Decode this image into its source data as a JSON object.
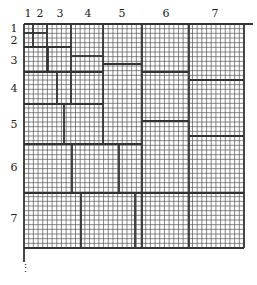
{
  "diagram": {
    "column_labels": [
      "1",
      "2",
      "3",
      "4",
      "5",
      "6",
      "7"
    ],
    "row_labels": [
      "1",
      "2",
      "3",
      "4",
      "5",
      "6",
      "7"
    ],
    "continuation_marker": "⋮",
    "grid": {
      "left": 24,
      "top": 24,
      "right": 244,
      "bottom": 248,
      "cell": 4.68,
      "block_bounds": [
        24,
        33,
        47,
        71,
        103,
        141,
        189,
        244
      ],
      "line_color": "#333333",
      "thin_color": "#555555"
    },
    "column_label_x": [
      28,
      40,
      60,
      88,
      122,
      166,
      215
    ],
    "row_label_y": [
      32,
      44,
      64,
      92,
      128,
      171,
      222
    ],
    "thick_segments": [
      [
        24,
        24,
        253,
        24
      ],
      [
        24,
        24,
        24,
        262
      ],
      [
        244,
        24,
        244,
        248
      ],
      [
        24,
        248,
        244,
        248
      ],
      [
        33,
        24,
        33,
        47
      ],
      [
        24,
        33,
        47,
        33
      ],
      [
        47,
        24,
        47,
        71
      ],
      [
        24,
        47,
        71,
        47
      ],
      [
        48,
        47,
        48,
        71
      ],
      [
        71,
        24,
        71,
        104
      ],
      [
        71,
        56,
        103,
        56
      ],
      [
        24,
        72,
        103,
        72
      ],
      [
        57,
        72,
        57,
        104
      ],
      [
        103,
        24,
        103,
        144
      ],
      [
        103,
        64,
        142,
        64
      ],
      [
        142,
        24,
        142,
        248
      ],
      [
        142,
        72,
        189,
        72
      ],
      [
        189,
        24,
        189,
        248
      ],
      [
        189,
        80,
        244,
        80
      ],
      [
        24,
        104,
        103,
        104
      ],
      [
        64,
        104,
        64,
        144
      ],
      [
        24,
        144,
        142,
        144
      ],
      [
        142,
        121,
        189,
        121
      ],
      [
        189,
        136,
        244,
        136
      ],
      [
        72,
        144,
        72,
        193
      ],
      [
        119,
        144,
        119,
        193
      ],
      [
        24,
        193,
        244,
        193
      ],
      [
        81,
        193,
        81,
        248
      ],
      [
        135,
        193,
        135,
        248
      ]
    ]
  }
}
